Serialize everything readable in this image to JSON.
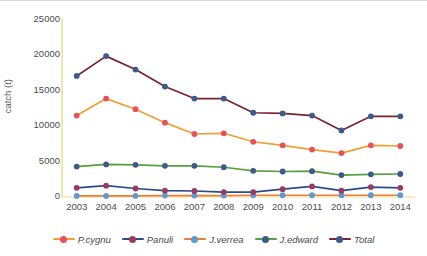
{
  "chart_data": {
    "type": "line",
    "title": "",
    "xlabel": "",
    "ylabel": "catch (t)",
    "categories": [
      "2003",
      "2004",
      "2005",
      "2006",
      "2007",
      "2008",
      "2009",
      "2010",
      "2011",
      "2012",
      "2013",
      "2014"
    ],
    "ylim": [
      0,
      25000
    ],
    "yticks": [
      0,
      5000,
      10000,
      15000,
      20000,
      25000
    ],
    "ytick_labels": [
      "0",
      "5000",
      "10000",
      "15000",
      "20000",
      "25000"
    ],
    "grid": false,
    "legend_position": "bottom",
    "series": [
      {
        "name": "P.cygnu",
        "color": "#f0a030",
        "marker_color": "#e8505b",
        "values": [
          11500,
          13900,
          12400,
          10500,
          8900,
          9000,
          7800,
          7300,
          6700,
          6200,
          7300,
          7200
        ]
      },
      {
        "name": "Panuli",
        "color": "#2e4a8c",
        "marker_color": "#9c3a5e",
        "values": [
          1300,
          1600,
          1200,
          900,
          850,
          700,
          700,
          1100,
          1500,
          900,
          1400,
          1300
        ]
      },
      {
        "name": "J.verrea",
        "color": "#ed7d31",
        "marker_color": "#5b9bd5",
        "values": [
          150,
          150,
          150,
          200,
          200,
          200,
          250,
          250,
          250,
          250,
          250,
          250
        ]
      },
      {
        "name": "J.edward",
        "color": "#5a9e3d",
        "marker_color": "#3c5a8c",
        "values": [
          4300,
          4600,
          4550,
          4400,
          4400,
          4200,
          3700,
          3600,
          3650,
          3100,
          3200,
          3250
        ]
      },
      {
        "name": "Total",
        "color": "#7b2233",
        "marker_color": "#3c5a8c",
        "values": [
          17100,
          19900,
          18000,
          15600,
          13900,
          13900,
          11900,
          11800,
          11500,
          9400,
          11400,
          11400
        ]
      }
    ]
  },
  "legend": {
    "items": [
      {
        "label": "P.cygnu"
      },
      {
        "label": "Panuli"
      },
      {
        "label": "J.verrea"
      },
      {
        "label": "J.edward"
      },
      {
        "label": "Total"
      }
    ]
  }
}
